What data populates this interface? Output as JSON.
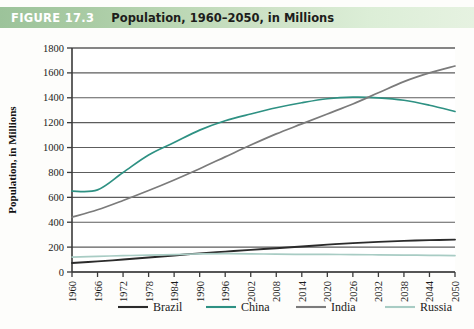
{
  "figure": {
    "number_label": "FIGURE 17.3",
    "title": "Population, 1960–2050, in Millions"
  },
  "colors": {
    "header_band_left": "#9cc39a",
    "header_band_right": "#e6f2e1",
    "header_number_text": "#ffffff",
    "header_title_text": "#1d1d1b",
    "brazil": "#2b2b2b",
    "china": "#2e9183",
    "india": "#7b7b7b",
    "russia": "#a8ccc4",
    "gridline": "#5d5d5d",
    "axis": "#3a3a3a",
    "plot_background": "#ffffff"
  },
  "chart_data": {
    "type": "line",
    "title": "Population, 1960–2050, in Millions",
    "xlabel": "",
    "ylabel": "Population, in Millions",
    "ylim": [
      0,
      1800
    ],
    "xlim": [
      1960,
      2050
    ],
    "ytick_step": 200,
    "xtick_step": 6,
    "grid": true,
    "legend_position": "bottom",
    "yticks": [
      0,
      200,
      400,
      600,
      800,
      1000,
      1200,
      1400,
      1600,
      1800
    ],
    "categories": [
      "1960",
      "1966",
      "1972",
      "1978",
      "1984",
      "1990",
      "1996",
      "2002",
      "2008",
      "2014",
      "2020",
      "2026",
      "2032",
      "2038",
      "2044",
      "2050"
    ],
    "x": [
      1960,
      1966,
      1972,
      1978,
      1984,
      1990,
      1996,
      2002,
      2008,
      2014,
      2020,
      2026,
      2032,
      2038,
      2044,
      2050
    ],
    "series": [
      {
        "name": "Brazil",
        "color": "#2b2b2b",
        "values": [
          72,
          85,
          100,
          116,
          133,
          150,
          164,
          178,
          191,
          205,
          220,
          232,
          242,
          250,
          256,
          260
        ]
      },
      {
        "name": "China",
        "color": "#2e9183",
        "values": [
          650,
          660,
          800,
          940,
          1040,
          1140,
          1215,
          1270,
          1320,
          1360,
          1392,
          1405,
          1400,
          1380,
          1340,
          1290
        ]
      },
      {
        "name": "India",
        "color": "#7b7b7b",
        "values": [
          440,
          500,
          575,
          655,
          740,
          830,
          925,
          1020,
          1110,
          1190,
          1270,
          1350,
          1440,
          1530,
          1600,
          1655
        ]
      },
      {
        "name": "Russia",
        "color": "#a8ccc4",
        "values": [
          120,
          126,
          131,
          136,
          140,
          145,
          147,
          146,
          143,
          142,
          141,
          140,
          138,
          136,
          134,
          132
        ]
      }
    ]
  },
  "legend": {
    "items": [
      {
        "label": "Brazil",
        "color": "#2b2b2b"
      },
      {
        "label": "China",
        "color": "#2e9183"
      },
      {
        "label": "India",
        "color": "#7b7b7b"
      },
      {
        "label": "Russia",
        "color": "#a8ccc4"
      }
    ]
  }
}
